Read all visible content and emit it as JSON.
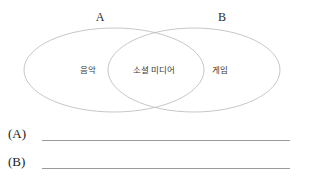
{
  "diagram": {
    "type": "venn",
    "sets": [
      {
        "id": "A",
        "label": "A",
        "region_label": "음악"
      },
      {
        "id": "B",
        "label": "B",
        "region_label": "게임"
      }
    ],
    "intersection_label": "소셜 미디어",
    "stroke_color": "#b9b9b9",
    "fill_color": "none"
  },
  "answers": {
    "rows": [
      {
        "tag": "(A)",
        "value": ""
      },
      {
        "tag": "(B)",
        "value": ""
      }
    ],
    "line_color": "#9a9a9a"
  }
}
